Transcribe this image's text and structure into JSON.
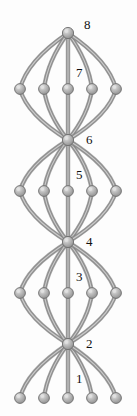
{
  "figure": {
    "name": "stacked-theta-graph",
    "width": 137,
    "height": 416,
    "background_color": "#fdfdfd"
  },
  "style": {
    "edge_color": "#8e8e8e",
    "edge_color_light": "#b9b9b9",
    "edge_color_dark": "#6f6f6f",
    "edge_width": 3.4,
    "node_fill": "#a9a9a9",
    "node_highlight": "#e2e2e2",
    "node_stroke": "#6d6d6d",
    "node_radius": 5.4,
    "hub_radius": 5.6,
    "label_color": "#101010",
    "label_font_size": 13
  },
  "chart_data": {
    "type": "diagram",
    "title": "",
    "nodes": [
      {
        "id": "hub8",
        "label": "8",
        "x": 68,
        "y": 33,
        "kind": "hub"
      },
      {
        "id": "r7a",
        "label": "",
        "x": 20,
        "y": 89,
        "kind": "rung"
      },
      {
        "id": "r7b",
        "label": "",
        "x": 44,
        "y": 89,
        "kind": "rung"
      },
      {
        "id": "r7c",
        "label": "7",
        "x": 68,
        "y": 89,
        "kind": "rung"
      },
      {
        "id": "r7d",
        "label": "",
        "x": 92,
        "y": 89,
        "kind": "rung"
      },
      {
        "id": "r7e",
        "label": "",
        "x": 116,
        "y": 89,
        "kind": "rung"
      },
      {
        "id": "hub6",
        "label": "6",
        "x": 68,
        "y": 140,
        "kind": "hub"
      },
      {
        "id": "r5a",
        "label": "",
        "x": 20,
        "y": 191,
        "kind": "rung"
      },
      {
        "id": "r5b",
        "label": "",
        "x": 44,
        "y": 191,
        "kind": "rung"
      },
      {
        "id": "r5c",
        "label": "5",
        "x": 68,
        "y": 191,
        "kind": "rung"
      },
      {
        "id": "r5d",
        "label": "",
        "x": 92,
        "y": 191,
        "kind": "rung"
      },
      {
        "id": "r5e",
        "label": "",
        "x": 116,
        "y": 191,
        "kind": "rung"
      },
      {
        "id": "hub4",
        "label": "4",
        "x": 68,
        "y": 242,
        "kind": "hub"
      },
      {
        "id": "r3a",
        "label": "",
        "x": 20,
        "y": 293,
        "kind": "rung"
      },
      {
        "id": "r3b",
        "label": "",
        "x": 44,
        "y": 293,
        "kind": "rung"
      },
      {
        "id": "r3c",
        "label": "3",
        "x": 68,
        "y": 293,
        "kind": "rung"
      },
      {
        "id": "r3d",
        "label": "",
        "x": 92,
        "y": 293,
        "kind": "rung"
      },
      {
        "id": "r3e",
        "label": "",
        "x": 116,
        "y": 293,
        "kind": "rung"
      },
      {
        "id": "hub2",
        "label": "2",
        "x": 68,
        "y": 344,
        "kind": "hub"
      },
      {
        "id": "r1a",
        "label": "",
        "x": 20,
        "y": 398,
        "kind": "rung"
      },
      {
        "id": "r1b",
        "label": "",
        "x": 44,
        "y": 398,
        "kind": "rung"
      },
      {
        "id": "r1c",
        "label": "1",
        "x": 68,
        "y": 398,
        "kind": "rung"
      },
      {
        "id": "r1d",
        "label": "",
        "x": 92,
        "y": 398,
        "kind": "rung"
      },
      {
        "id": "r1e",
        "label": "",
        "x": 116,
        "y": 398,
        "kind": "rung"
      }
    ],
    "labels": [
      {
        "text": "8",
        "x": 84,
        "y": 18,
        "for": "hub8"
      },
      {
        "text": "7",
        "x": 76,
        "y": 66,
        "for": "r7c"
      },
      {
        "text": "6",
        "x": 86,
        "y": 133,
        "for": "hub6"
      },
      {
        "text": "5",
        "x": 76,
        "y": 168,
        "for": "r5c"
      },
      {
        "text": "4",
        "x": 86,
        "y": 235,
        "for": "hub4"
      },
      {
        "text": "3",
        "x": 76,
        "y": 270,
        "for": "r3c"
      },
      {
        "text": "2",
        "x": 86,
        "y": 337,
        "for": "hub2"
      },
      {
        "text": "1",
        "x": 76,
        "y": 372,
        "for": "r1c"
      }
    ],
    "bundles": [
      {
        "top_hub": "hub8",
        "bottom_hub": "hub6",
        "rung_row_label": "7",
        "rung_count": 5
      },
      {
        "top_hub": "hub6",
        "bottom_hub": "hub4",
        "rung_row_label": "5",
        "rung_count": 5
      },
      {
        "top_hub": "hub4",
        "bottom_hub": "hub2",
        "rung_row_label": "3",
        "rung_count": 5
      },
      {
        "top_hub": "hub2",
        "bottom_hub": null,
        "rung_row_label": "1",
        "rung_count": 5
      }
    ],
    "edges": [
      {
        "from": "hub8",
        "to": "r7a"
      },
      {
        "from": "hub8",
        "to": "r7b"
      },
      {
        "from": "hub8",
        "to": "r7c"
      },
      {
        "from": "hub8",
        "to": "r7d"
      },
      {
        "from": "hub8",
        "to": "r7e"
      },
      {
        "from": "r7a",
        "to": "hub6"
      },
      {
        "from": "r7b",
        "to": "hub6"
      },
      {
        "from": "r7c",
        "to": "hub6"
      },
      {
        "from": "r7d",
        "to": "hub6"
      },
      {
        "from": "r7e",
        "to": "hub6"
      },
      {
        "from": "hub6",
        "to": "r5a"
      },
      {
        "from": "hub6",
        "to": "r5b"
      },
      {
        "from": "hub6",
        "to": "r5c"
      },
      {
        "from": "hub6",
        "to": "r5d"
      },
      {
        "from": "hub6",
        "to": "r5e"
      },
      {
        "from": "r5a",
        "to": "hub4"
      },
      {
        "from": "r5b",
        "to": "hub4"
      },
      {
        "from": "r5c",
        "to": "hub4"
      },
      {
        "from": "r5d",
        "to": "hub4"
      },
      {
        "from": "r5e",
        "to": "hub4"
      },
      {
        "from": "hub4",
        "to": "r3a"
      },
      {
        "from": "hub4",
        "to": "r3b"
      },
      {
        "from": "hub4",
        "to": "r3c"
      },
      {
        "from": "hub4",
        "to": "r3d"
      },
      {
        "from": "hub4",
        "to": "r3e"
      },
      {
        "from": "r3a",
        "to": "hub2"
      },
      {
        "from": "r3b",
        "to": "hub2"
      },
      {
        "from": "r3c",
        "to": "hub2"
      },
      {
        "from": "r3d",
        "to": "hub2"
      },
      {
        "from": "r3e",
        "to": "hub2"
      },
      {
        "from": "hub2",
        "to": "r1a"
      },
      {
        "from": "hub2",
        "to": "r1b"
      },
      {
        "from": "hub2",
        "to": "r1c"
      },
      {
        "from": "hub2",
        "to": "r1d"
      },
      {
        "from": "hub2",
        "to": "r1e"
      }
    ]
  }
}
